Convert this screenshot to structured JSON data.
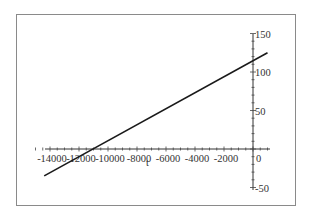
{
  "chart_data": {
    "type": "line",
    "title": "",
    "xlabel": "t",
    "ylabel": "",
    "xlim": [
      -15000,
      1500
    ],
    "ylim": [
      -50,
      150
    ],
    "grid": false,
    "legend": null,
    "x_ticks": [
      -14000,
      -12000,
      -10000,
      -8000,
      -6000,
      -4000,
      -2000,
      0
    ],
    "x_tick_labels": [
      "-14000",
      "-12000",
      "-10000",
      "-8000",
      "-6000",
      "-4000",
      "-2000",
      "0"
    ],
    "y_ticks": [
      150,
      100,
      50,
      -50
    ],
    "y_tick_labels": [
      "150",
      "100",
      "50",
      "-50"
    ],
    "series": [
      {
        "name": "line",
        "color": "#1a1a1a",
        "x": [
          -14400,
          -11600,
          -6000,
          0,
          1000
        ],
        "y": [
          -35,
          0,
          57,
          115,
          125
        ]
      }
    ]
  },
  "axis_title_x": "t",
  "labels": {
    "x": [
      "-14000",
      "-12000",
      "-10000",
      "-8000",
      "-6000",
      "-4000",
      "-2000",
      "0"
    ],
    "y": [
      "150",
      "100",
      "50",
      "-50"
    ]
  }
}
